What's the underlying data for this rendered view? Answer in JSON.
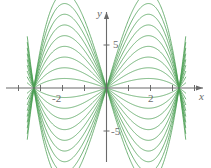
{
  "figure": {
    "name": "family-of-curves-plot",
    "background_color": "#ffffff",
    "curve_color": "#4a9e52",
    "axis_color": "#6b6b6b",
    "label_color": "#6b6b6b"
  },
  "axes": {
    "x_axis_label": "x",
    "y_axis_label": "y",
    "x_ticks": [
      {
        "value": -4,
        "label": ""
      },
      {
        "value": -3,
        "label": ""
      },
      {
        "value": -2,
        "label": "-2"
      },
      {
        "value": -1,
        "label": ""
      },
      {
        "value": 1,
        "label": ""
      },
      {
        "value": 2,
        "label": "2"
      },
      {
        "value": 3,
        "label": ""
      },
      {
        "value": 4,
        "label": ""
      }
    ],
    "y_ticks": [
      {
        "value": 5,
        "label": "5"
      },
      {
        "value": -5,
        "label": "-5"
      }
    ],
    "x_tick_labels_visible": [
      "-2",
      "2"
    ],
    "y_tick_labels_visible": [
      "5",
      "-5"
    ],
    "arrow_heads": [
      "x-positive",
      "y-positive"
    ]
  },
  "chart_data": {
    "type": "line",
    "title": "",
    "subtitle": "",
    "xlabel": "x",
    "ylabel": "y",
    "xlim": [
      -4.8,
      4.8
    ],
    "ylim": [
      -9.5,
      9.5
    ],
    "grid": false,
    "legend": false,
    "legend_position": "none",
    "node_points": [
      {
        "x": -3.3,
        "y": 0
      },
      {
        "x": 0,
        "y": 0
      },
      {
        "x": 3.3,
        "y": 0
      }
    ],
    "x_tick_values": [
      -4,
      -3,
      -2,
      -1,
      1,
      2,
      3,
      4
    ],
    "y_tick_values": [
      -5,
      5
    ],
    "series": [
      {
        "name": "a = 0.08",
        "amplitude": 0.08
      },
      {
        "name": "a = 0.17",
        "amplitude": 0.17
      },
      {
        "name": "a = 0.26",
        "amplitude": 0.26
      },
      {
        "name": "a = 0.35",
        "amplitude": 0.35
      },
      {
        "name": "a = 0.44",
        "amplitude": 0.44
      },
      {
        "name": "a = 0.53",
        "amplitude": 0.53
      },
      {
        "name": "a = 0.62",
        "amplitude": 0.62
      },
      {
        "name": "a = 0.71",
        "amplitude": 0.71
      },
      {
        "name": "a = 0.80",
        "amplitude": 0.8
      }
    ]
  }
}
